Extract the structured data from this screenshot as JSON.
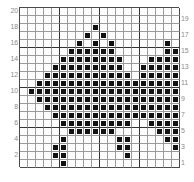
{
  "chart_data": {
    "type": "heatmap",
    "title": "",
    "subtitle": "",
    "xlabel": "",
    "ylabel": "",
    "grid": true,
    "legend_position": "none",
    "columns": 20,
    "rows": 20,
    "xlim": [
      1,
      20
    ],
    "ylim": [
      1,
      20
    ],
    "left_axis_ticks": [
      "20",
      "18",
      "16",
      "14",
      "12",
      "10",
      "8",
      "6",
      "4",
      "2"
    ],
    "right_axis_ticks": [
      "19",
      "17",
      "15",
      "13",
      "11",
      "9",
      "7",
      "5",
      "3",
      "1"
    ],
    "cell_values": {
      "on": 1,
      "off": 0
    },
    "symbol_color": "#111111",
    "grid_line_color": "#9a9a9a",
    "major_grid_line_color": "#333333",
    "background_color": "#ffffff",
    "tick_label_color": "#8c8c8c",
    "rows_data": [
      [
        0,
        0,
        0,
        0,
        0,
        0,
        0,
        0,
        0,
        0,
        0,
        0,
        0,
        0,
        0,
        0,
        0,
        0,
        0,
        0
      ],
      [
        0,
        0,
        0,
        0,
        0,
        0,
        0,
        0,
        0,
        0,
        0,
        0,
        0,
        0,
        0,
        0,
        0,
        0,
        0,
        0
      ],
      [
        0,
        0,
        0,
        0,
        0,
        0,
        0,
        0,
        0,
        1,
        0,
        0,
        0,
        0,
        0,
        0,
        0,
        0,
        0,
        0
      ],
      [
        0,
        0,
        0,
        0,
        0,
        0,
        0,
        0,
        1,
        0,
        1,
        0,
        0,
        0,
        0,
        0,
        0,
        0,
        0,
        0
      ],
      [
        0,
        0,
        0,
        0,
        0,
        0,
        0,
        1,
        0,
        1,
        0,
        1,
        0,
        0,
        0,
        0,
        0,
        0,
        1,
        0
      ],
      [
        0,
        0,
        0,
        0,
        0,
        0,
        1,
        1,
        1,
        1,
        1,
        1,
        0,
        0,
        0,
        0,
        0,
        0,
        1,
        1
      ],
      [
        0,
        0,
        0,
        0,
        0,
        1,
        1,
        1,
        1,
        1,
        1,
        1,
        1,
        0,
        0,
        0,
        1,
        1,
        1,
        1
      ],
      [
        0,
        0,
        0,
        0,
        1,
        1,
        1,
        1,
        1,
        1,
        1,
        1,
        1,
        0,
        0,
        1,
        1,
        1,
        1,
        1
      ],
      [
        0,
        0,
        0,
        1,
        1,
        1,
        1,
        1,
        1,
        1,
        1,
        1,
        1,
        1,
        0,
        1,
        1,
        1,
        1,
        1
      ],
      [
        0,
        0,
        1,
        1,
        1,
        1,
        1,
        1,
        1,
        1,
        1,
        1,
        1,
        1,
        1,
        1,
        1,
        1,
        1,
        1
      ],
      [
        0,
        1,
        1,
        1,
        1,
        1,
        1,
        1,
        1,
        1,
        1,
        1,
        1,
        1,
        1,
        1,
        1,
        1,
        1,
        1
      ],
      [
        0,
        0,
        1,
        1,
        1,
        1,
        1,
        1,
        1,
        1,
        1,
        1,
        1,
        1,
        1,
        1,
        1,
        1,
        1,
        1
      ],
      [
        0,
        0,
        0,
        1,
        1,
        1,
        1,
        1,
        1,
        1,
        1,
        1,
        1,
        1,
        1,
        1,
        1,
        1,
        1,
        1
      ],
      [
        0,
        0,
        0,
        0,
        1,
        1,
        1,
        1,
        1,
        1,
        1,
        1,
        1,
        1,
        1,
        1,
        1,
        1,
        1,
        1
      ],
      [
        0,
        0,
        0,
        0,
        0,
        1,
        1,
        1,
        1,
        1,
        1,
        1,
        1,
        1,
        0,
        0,
        1,
        1,
        1,
        1
      ],
      [
        0,
        0,
        0,
        0,
        0,
        0,
        1,
        1,
        1,
        1,
        1,
        1,
        0,
        0,
        0,
        0,
        0,
        1,
        1,
        1
      ],
      [
        0,
        0,
        0,
        0,
        0,
        1,
        0,
        0,
        0,
        0,
        0,
        0,
        1,
        1,
        0,
        0,
        0,
        0,
        1,
        1
      ],
      [
        0,
        0,
        0,
        0,
        1,
        1,
        0,
        0,
        0,
        0,
        0,
        0,
        1,
        1,
        0,
        0,
        0,
        0,
        0,
        1
      ],
      [
        0,
        0,
        0,
        0,
        1,
        1,
        0,
        0,
        0,
        0,
        0,
        0,
        0,
        1,
        0,
        0,
        0,
        0,
        0,
        0
      ],
      [
        0,
        0,
        0,
        0,
        0,
        1,
        0,
        0,
        0,
        0,
        0,
        0,
        0,
        0,
        0,
        0,
        0,
        0,
        0,
        0
      ]
    ]
  }
}
